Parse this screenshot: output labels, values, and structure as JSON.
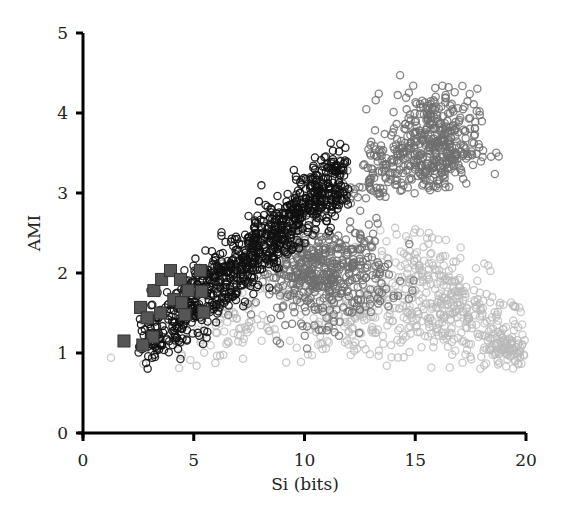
{
  "chart_data": {
    "type": "scatter",
    "title": "",
    "xlabel": "Si (bits)",
    "ylabel": "AMI",
    "xlim": [
      0,
      20
    ],
    "ylim": [
      0,
      5
    ],
    "xticks": [
      0,
      5,
      10,
      15,
      20
    ],
    "yticks": [
      0,
      1,
      2,
      3,
      4,
      5
    ],
    "grid": false,
    "legend": null,
    "series": [
      {
        "name": "light-gray-circles",
        "marker": "circle",
        "color": "#b8b8b8",
        "description": "light gray open circles, broad cloud spanning Si 1.5–20, AMI 0.9–2.5",
        "clusters": [
          {
            "cx": 16.5,
            "cy": 1.6,
            "sx": 2.0,
            "sy": 0.35,
            "n": 420,
            "tilt": -0.18
          },
          {
            "cx": 12.5,
            "cy": 1.4,
            "sx": 2.0,
            "sy": 0.25,
            "n": 200,
            "tilt": 0.0
          },
          {
            "cx": 6.5,
            "cy": 1.4,
            "sx": 2.0,
            "sy": 0.3,
            "n": 120,
            "tilt": 0.15
          },
          {
            "cx": 19.2,
            "cy": 1.05,
            "sx": 0.4,
            "sy": 0.1,
            "n": 60,
            "tilt": 0.0
          }
        ]
      },
      {
        "name": "mid-gray-circles",
        "marker": "circle",
        "color": "#6e6e6e",
        "description": "mid gray open circles: central hump (Si 7–14, AMI 1.5–2.8) and upper triangle (Si 12–17.5, AMI 3–4.5)",
        "clusters": [
          {
            "cx": 10.8,
            "cy": 2.0,
            "sx": 1.5,
            "sy": 0.3,
            "n": 500,
            "tilt": 0.0
          },
          {
            "cx": 15.8,
            "cy": 3.6,
            "sx": 1.0,
            "sy": 0.35,
            "n": 420,
            "tilt": 0.0
          },
          {
            "cx": 13.5,
            "cy": 3.2,
            "sx": 1.0,
            "sy": 0.3,
            "n": 120,
            "tilt": 0.2
          }
        ]
      },
      {
        "name": "black-circles",
        "marker": "circle",
        "color": "#111111",
        "description": "black open circles along diagonal band from (2.5,1.0) to (12,3.3)",
        "band": {
          "x0": 2.6,
          "y0": 1.05,
          "x1": 11.8,
          "y1": 3.25,
          "width": 0.22,
          "n": 900
        }
      },
      {
        "name": "dark-squares",
        "marker": "square",
        "color": "#555555",
        "points": [
          [
            1.85,
            1.15
          ],
          [
            2.6,
            1.57
          ],
          [
            2.9,
            1.44
          ],
          [
            3.2,
            1.78
          ],
          [
            3.55,
            1.92
          ],
          [
            3.95,
            2.03
          ],
          [
            4.1,
            1.67
          ],
          [
            4.4,
            1.92
          ],
          [
            4.45,
            1.63
          ],
          [
            4.75,
            1.78
          ],
          [
            5.3,
            2.03
          ],
          [
            5.35,
            1.77
          ],
          [
            5.45,
            1.51
          ],
          [
            3.15,
            1.2
          ],
          [
            2.7,
            1.1
          ],
          [
            4.6,
            1.48
          ],
          [
            3.5,
            1.5
          ]
        ]
      }
    ]
  }
}
